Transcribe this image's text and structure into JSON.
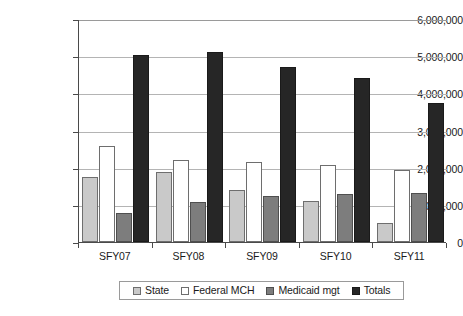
{
  "chart_data": {
    "type": "bar",
    "title": "",
    "subtitle": "",
    "xlabel": "",
    "ylabel": "",
    "categories": [
      "SFY07",
      "SFY08",
      "SFY09",
      "SFY10",
      "SFY11"
    ],
    "series": [
      {
        "name": "State",
        "color": "#c9c9c9",
        "values": [
          1760000,
          1880000,
          1405000,
          1115000,
          525000
        ]
      },
      {
        "name": "Federal MCH",
        "color": "#ffffff",
        "values": [
          2570000,
          2215000,
          2140000,
          2080000,
          1945000
        ]
      },
      {
        "name": "Medicaid mgt",
        "color": "#7d7d7d",
        "values": [
          780000,
          1090000,
          1235000,
          1285000,
          1330000
        ]
      },
      {
        "name": "Totals",
        "color": "#262626",
        "values": [
          5030000,
          5105000,
          4715000,
          4415000,
          3745000
        ]
      }
    ],
    "ylim": [
      0,
      6000000
    ],
    "ytick_values": [
      0,
      1000000,
      2000000,
      3000000,
      4000000,
      5000000,
      6000000
    ],
    "ytick_labels": [
      "0",
      "1,000,000",
      "2,000,000",
      "3,000,000",
      "4,000,000",
      "5,000,000",
      "6,000,000"
    ],
    "grid": true,
    "grid_axis": "y",
    "legend_position": "bottom",
    "legend_entries": [
      "State",
      "Federal MCH",
      "Medicaid mgt",
      "Totals"
    ]
  }
}
